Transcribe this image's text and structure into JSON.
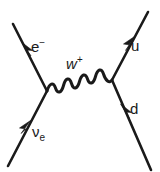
{
  "diagram": {
    "background_color": "#ffffff",
    "line_color": "#1a1a1a",
    "labels": {
      "electron": {
        "symbol": "e",
        "superscript": "−",
        "name": "electron"
      },
      "neutrino": {
        "symbol": "ν",
        "subscript": "e",
        "name": "electron-neutrino"
      },
      "wboson": {
        "symbol": "w",
        "superscript": "+",
        "name": "w-boson"
      },
      "up_quark": {
        "symbol": "u",
        "name": "up-quark"
      },
      "down_quark": {
        "symbol": "d",
        "name": "down-quark"
      }
    },
    "vertices": {
      "left": {
        "x": 47,
        "y": 91
      },
      "right": {
        "x": 112,
        "y": 80
      }
    },
    "propagator": {
      "type": "wavy",
      "particle": "W+",
      "from": "left-vertex",
      "to": "right-vertex"
    },
    "legs": [
      {
        "name": "incoming-neutrino",
        "from": {
          "x": 8,
          "y": 166
        },
        "to": {
          "x": 47,
          "y": 91
        },
        "arrow_direction": "up-right"
      },
      {
        "name": "outgoing-electron",
        "from": {
          "x": 47,
          "y": 91
        },
        "to": {
          "x": 13,
          "y": 24
        },
        "arrow_direction": "up-left"
      },
      {
        "name": "incoming-down-quark",
        "from": {
          "x": 151,
          "y": 170
        },
        "to": {
          "x": 112,
          "y": 80
        },
        "arrow_direction": "up-left"
      },
      {
        "name": "outgoing-up-quark",
        "from": {
          "x": 112,
          "y": 80
        },
        "to": {
          "x": 148,
          "y": 12
        },
        "arrow_direction": "up-right"
      }
    ]
  }
}
